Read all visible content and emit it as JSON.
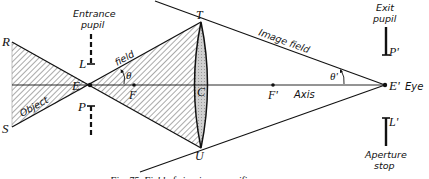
{
  "diagram": {
    "labels": {
      "R": "R",
      "S": "S",
      "E": "E",
      "F": "F",
      "T": "T",
      "U": "U",
      "C": "C",
      "F_prime": "F'",
      "E_prime": "E'",
      "L": "L",
      "P": "P",
      "P_prime": "P'",
      "L_prime": "L'",
      "theta": "θ",
      "theta_prime": "θ'",
      "object": "Object",
      "field": "field",
      "image_field": "Image field",
      "axis": "Axis",
      "eye": "Eye",
      "entrance_pupil_line1": "Entrance",
      "entrance_pupil_line2": "pupil",
      "exit_pupil_line1": "Exit",
      "exit_pupil_line2": "pupil",
      "aperture_stop_line1": "Aperture",
      "aperture_stop_line2": "stop"
    },
    "caption": "Fig. 75. Field of view in a magnifier",
    "colors": {
      "ink": "#111111",
      "lens_fill": "#c8c8c8",
      "hatch": "#444444",
      "background": "#ffffff"
    }
  }
}
